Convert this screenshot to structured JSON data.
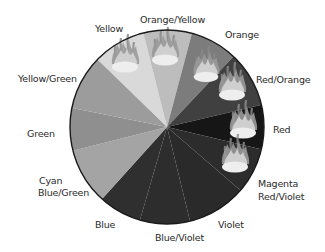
{
  "wheel": {
    "center": [
      167,
      127
    ],
    "radius": 97,
    "slices": [
      {
        "name": "Yellow",
        "color": "#d9d9d9",
        "from": [
          100,
          62
        ],
        "to": [
          143,
          32
        ],
        "flame": true
      },
      {
        "name": "Orange/Yellow",
        "color": "#bdbdbd",
        "from": [
          143,
          32
        ],
        "to": [
          192,
          33
        ],
        "flame": true
      },
      {
        "name": "Orange",
        "color": "#7c7c7c",
        "from": [
          192,
          33
        ],
        "to": [
          233,
          57
        ],
        "flame": true
      },
      {
        "name": "Red/Orange",
        "color": "#404040",
        "from": [
          233,
          57
        ],
        "to": [
          261,
          105
        ],
        "flame": true
      },
      {
        "name": "Red",
        "color": "#161616",
        "from": [
          261,
          105
        ],
        "to": [
          264,
          150
        ],
        "flame": true
      },
      {
        "name": "Magenta Red/Violet",
        "color": "#2c2c2c",
        "from": [
          264,
          150
        ],
        "to": [
          240,
          190
        ],
        "flame": true
      },
      {
        "name": "Violet",
        "color": "#2a2a2a",
        "from": [
          240,
          190
        ],
        "to": [
          190,
          221
        ],
        "flame": false
      },
      {
        "name": "Blue/Violet",
        "color": "#2d2d2d",
        "from": [
          190,
          221
        ],
        "to": [
          140,
          220
        ],
        "flame": false
      },
      {
        "name": "Blue",
        "color": "#2f2f2f",
        "from": [
          140,
          220
        ],
        "to": [
          102,
          199
        ],
        "flame": false
      },
      {
        "name": "Cyan Blue/Green",
        "color": "#a4a4a4",
        "from": [
          102,
          199
        ],
        "to": [
          72,
          151
        ],
        "flame": false
      },
      {
        "name": "Green",
        "color": "#8f8f8f",
        "from": [
          72,
          151
        ],
        "to": [
          72,
          108
        ],
        "flame": false
      },
      {
        "name": "Yellow/Green",
        "color": "#9c9c9c",
        "from": [
          72,
          108
        ],
        "to": [
          100,
          62
        ],
        "flame": false
      }
    ],
    "flames": [
      {
        "x": 125,
        "y": 64,
        "s": 1.0
      },
      {
        "x": 165,
        "y": 57,
        "s": 1.0
      },
      {
        "x": 206,
        "y": 74,
        "s": 0.95
      },
      {
        "x": 232,
        "y": 92,
        "s": 1.0
      },
      {
        "x": 243,
        "y": 130,
        "s": 1.0
      },
      {
        "x": 235,
        "y": 164,
        "s": 1.0
      }
    ]
  },
  "labels": {
    "yellow": "Yellow",
    "orange_yellow": "Orange/Yellow",
    "orange": "Orange",
    "red_orange": "Red/Orange",
    "red": "Red",
    "magenta": "Magenta",
    "red_violet": "Red/Violet",
    "violet": "Violet",
    "blue_violet": "Blue/Violet",
    "blue": "Blue",
    "cyan": "Cyan",
    "blue_green": "Blue/Green",
    "green": "Green",
    "yellow_green": "Yellow/Green"
  }
}
